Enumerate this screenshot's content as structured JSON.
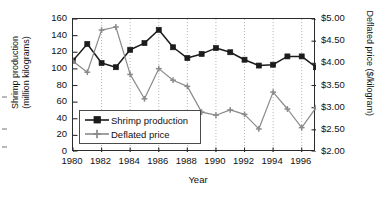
{
  "figure": {
    "background": "#ffffff",
    "frame_color": "#2b2b2b"
  },
  "axes": {
    "x": {
      "title": "Year",
      "ticks": [
        "1980",
        "1982",
        "1984",
        "1986",
        "1988",
        "1990",
        "1992",
        "1994",
        "1996"
      ],
      "min": 1980,
      "max": 1997
    },
    "y_left": {
      "title_line1": "Shrimp production",
      "title_line2": "(million kilograms)",
      "ticks": [
        "0",
        "20",
        "40",
        "60",
        "80",
        "100",
        "120",
        "140",
        "160"
      ],
      "min": 0,
      "max": 160
    },
    "y_right": {
      "title": "Deflated price ($/kilogram)",
      "ticks": [
        "$2.00",
        "$2.50",
        "$3.00",
        "$3.50",
        "$4.00",
        "$4.50",
        "$5.00"
      ],
      "min": 2.0,
      "max": 5.0
    }
  },
  "legend": {
    "position": "inside-lower-left",
    "entries": [
      {
        "label": "Shrimp production",
        "color": "#1c1c1c",
        "marker": "square"
      },
      {
        "label": "Deflated price",
        "color": "#8a8a8a",
        "marker": "plus"
      }
    ]
  },
  "chart_data": {
    "type": "line",
    "title": "",
    "xlabel": "Year",
    "ylabel": "Shrimp production (million kilograms)",
    "y2label": "Deflated price ($/kilogram)",
    "grid": "vertical-dotted-every-2-years",
    "legend_position": "inside-lower-left",
    "x": [
      1980,
      1981,
      1982,
      1983,
      1984,
      1985,
      1986,
      1987,
      1988,
      1989,
      1990,
      1991,
      1992,
      1993,
      1994,
      1995,
      1996,
      1997
    ],
    "xlim": [
      1980,
      1997
    ],
    "ylim": [
      0,
      160
    ],
    "y2lim": [
      2.0,
      5.0
    ],
    "series": [
      {
        "name": "Shrimp production",
        "axis": "left",
        "unit": "million kilograms",
        "color": "#1c1c1c",
        "marker": "square",
        "values": [
          110,
          130,
          107,
          102,
          123,
          131,
          147,
          126,
          113,
          118,
          125,
          120,
          111,
          104,
          105,
          115,
          115,
          102
        ]
      },
      {
        "name": "Deflated price",
        "axis": "right",
        "unit": "$/kilogram",
        "color": "#8a8a8a",
        "marker": "plus",
        "values": [
          4.05,
          3.8,
          4.75,
          4.82,
          3.75,
          3.2,
          3.88,
          3.62,
          3.48,
          2.9,
          2.83,
          2.95,
          2.85,
          2.52,
          3.35,
          2.97,
          2.55,
          3.0
        ]
      }
    ]
  }
}
